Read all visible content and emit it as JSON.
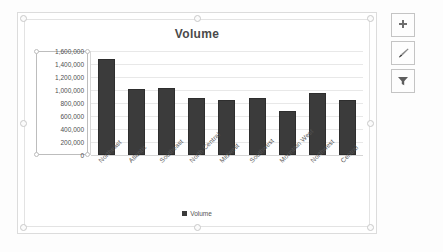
{
  "chart_data": {
    "type": "bar",
    "title": "Volume",
    "xlabel": "",
    "ylabel": "",
    "categories": [
      "Northeast",
      "Atlantic",
      "Southeast",
      "North Central",
      "Midwest",
      "Southwest",
      "Mountain West",
      "Northwest",
      "Central"
    ],
    "values": [
      1480000,
      1010000,
      1030000,
      880000,
      850000,
      870000,
      680000,
      960000,
      840000
    ],
    "series": [
      {
        "name": "Volume",
        "values": [
          1480000,
          1010000,
          1030000,
          880000,
          850000,
          870000,
          680000,
          960000,
          840000
        ]
      }
    ],
    "ylim": [
      0,
      1600000
    ],
    "ytick_step": 200000,
    "ytick_labels": [
      "1,600,000",
      "1,400,000",
      "1,200,000",
      "1,000,000",
      "800,000",
      "600,000",
      "400,000",
      "200,000",
      "0"
    ],
    "ytick_values": [
      1600000,
      1400000,
      1200000,
      1000000,
      800000,
      600000,
      400000,
      200000,
      0
    ],
    "grid": true,
    "legend": {
      "position": "bottom",
      "entries": [
        "Volume"
      ]
    },
    "bar_color": "#3b3b3b",
    "gridline_color": "#e8e8e8",
    "plot_background": "#ffffff"
  },
  "chart": {
    "title": "Volume",
    "legend_label": "Volume"
  },
  "buttons": [
    {
      "name": "chart-elements",
      "icon": "plus-icon",
      "label": "Chart Elements"
    },
    {
      "name": "chart-styles",
      "icon": "brush-icon",
      "label": "Chart Styles"
    },
    {
      "name": "chart-filters",
      "icon": "funnel-icon",
      "label": "Chart Filters"
    }
  ]
}
